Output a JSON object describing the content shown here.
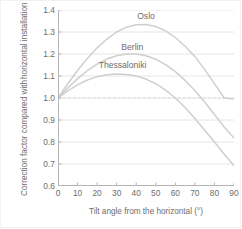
{
  "chart_data": {
    "type": "line",
    "title": "",
    "xlabel": "Tilt angle from the horizontal (°)",
    "ylabel_line1": "Correction factor compared with",
    "ylabel_line2": "horizontal installation (-)",
    "xlim": [
      0,
      90
    ],
    "ylim": [
      0.6,
      1.4
    ],
    "xticks": [
      0,
      10,
      20,
      30,
      40,
      50,
      60,
      70,
      80,
      90
    ],
    "xtick_labels": [
      "0",
      "10",
      "20",
      "30",
      "40",
      "50",
      "60",
      "70",
      "80",
      "90"
    ],
    "yticks": [
      0.6,
      0.7,
      0.8,
      0.9,
      1.0,
      1.1,
      1.2,
      1.3,
      1.4
    ],
    "ytick_labels": [
      "0.6",
      "0.7",
      "0.8",
      "0.9",
      "1.0",
      "1.1",
      "1.2",
      "1.3",
      "1.4"
    ],
    "grid": true,
    "grid_color": "#e0e0e0",
    "axis_color": "#b5b5b5",
    "line_color": "#cfcfcf",
    "text_color": "#6d6d6d",
    "legend_position": "inline-labels",
    "reference_line": {
      "y": 1.0,
      "style": "dashed",
      "color": "#d8d8d8"
    },
    "x": [
      0,
      5,
      10,
      15,
      20,
      25,
      30,
      35,
      40,
      45,
      50,
      55,
      60,
      65,
      70,
      75,
      80,
      85,
      90
    ],
    "series": [
      {
        "name": "Oslo",
        "label_x": 45,
        "label_y": 1.375,
        "values": [
          1.0,
          1.065,
          1.125,
          1.18,
          1.228,
          1.268,
          1.3,
          1.322,
          1.333,
          1.334,
          1.325,
          1.305,
          1.275,
          1.235,
          1.188,
          1.13,
          1.065,
          1.0,
          0.995
        ]
      },
      {
        "name": "Berlin",
        "label_x": 38,
        "label_y": 1.232,
        "values": [
          1.0,
          1.046,
          1.088,
          1.124,
          1.154,
          1.177,
          1.192,
          1.2,
          1.2,
          1.192,
          1.176,
          1.152,
          1.12,
          1.08,
          1.034,
          0.982,
          0.925,
          0.868,
          0.818
        ]
      },
      {
        "name": "Thessaloniki",
        "label_x": 33,
        "label_y": 1.152,
        "values": [
          1.0,
          1.032,
          1.06,
          1.082,
          1.097,
          1.106,
          1.109,
          1.107,
          1.1,
          1.086,
          1.065,
          1.036,
          1.0,
          0.957,
          0.907,
          0.853,
          0.8,
          0.744,
          0.692
        ]
      }
    ]
  }
}
